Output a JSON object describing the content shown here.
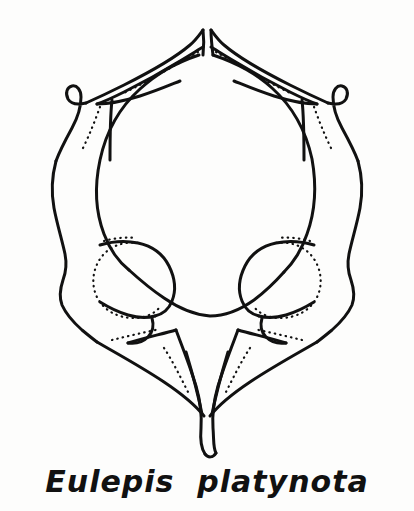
{
  "figure": {
    "kind": "scientific-line-drawing",
    "ink_color": "#111111",
    "background_color": "#fdfdfc",
    "solid_line_width_px": 3,
    "dotted_line_width_px": 2.2,
    "dotted_dash_pattern": "0.5 5",
    "parts": [
      {
        "name": "neural-spine-left-prong",
        "label": "left dorsal prong"
      },
      {
        "name": "neural-spine-right-prong",
        "label": "right dorsal prong"
      },
      {
        "name": "transverse-process-left",
        "label": "left transverse process"
      },
      {
        "name": "transverse-process-right",
        "label": "right transverse process"
      },
      {
        "name": "neural-canal",
        "label": "central foramen"
      },
      {
        "name": "articular-facet-left",
        "label": "left articular facet"
      },
      {
        "name": "articular-facet-right",
        "label": "right articular facet"
      },
      {
        "name": "ventral-keel",
        "label": "ventral keel"
      }
    ]
  },
  "caption": {
    "genus": "Eulepis",
    "species": "platynota",
    "text": "Eulepis  platynota"
  }
}
